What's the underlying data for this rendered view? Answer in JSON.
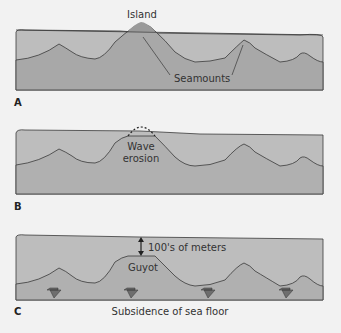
{
  "panels": [
    {
      "id": "A",
      "letter": "A",
      "labels": {
        "island": "Island",
        "seamounts": "Seamounts"
      }
    },
    {
      "id": "B",
      "letter": "B",
      "labels": {
        "wave_erosion_line1": "Wave",
        "wave_erosion_line2": "erosion"
      }
    },
    {
      "id": "C",
      "letter": "C",
      "labels": {
        "depth": "100's of meters",
        "guyot": "Guyot",
        "subsidence": "Subsidence of sea floor"
      }
    }
  ],
  "colors": {
    "water": "#b5b5b5",
    "water_light": "#c4c4c4",
    "seamount": "#9e9e9e",
    "outline": "#3a3a3a",
    "arrow": "#6e6e6e",
    "background": "#f2f2f2"
  }
}
